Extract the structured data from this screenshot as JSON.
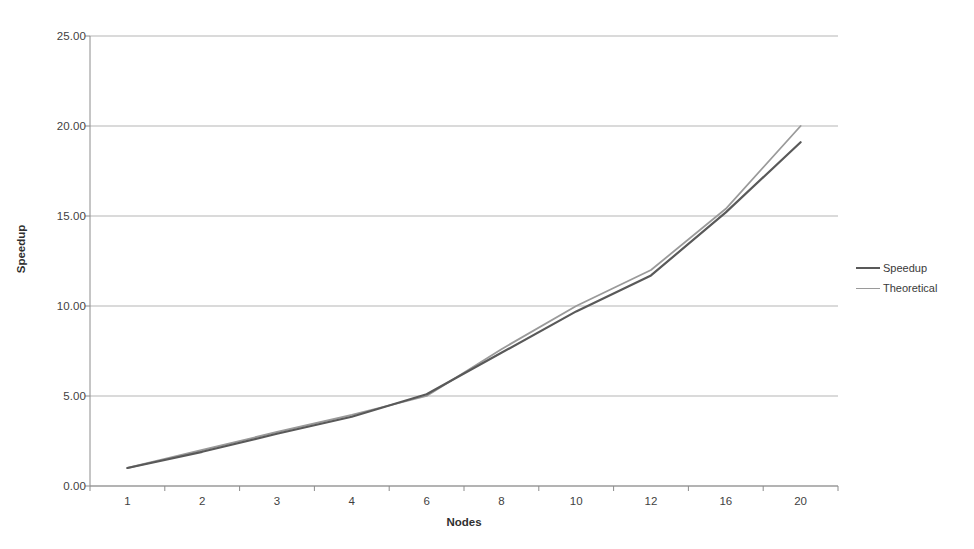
{
  "chart_data": {
    "type": "line",
    "title": "",
    "xlabel": "Nodes",
    "ylabel": "Speedup",
    "categories": [
      "1",
      "2",
      "3",
      "4",
      "6",
      "8",
      "10",
      "12",
      "16",
      "20"
    ],
    "series": [
      {
        "name": "Speedup",
        "color": "#595959",
        "values": [
          1.0,
          1.9,
          2.9,
          3.85,
          5.1,
          7.4,
          9.7,
          11.7,
          15.2,
          19.1
        ]
      },
      {
        "name": "Theoretical",
        "color": "#9a9a9a",
        "values": [
          1.0,
          2.0,
          3.0,
          3.95,
          5.0,
          7.6,
          10.0,
          12.0,
          15.4,
          20.0
        ]
      }
    ],
    "ylim": [
      0.0,
      25.0
    ],
    "yticks": [
      "0.00",
      "5.00",
      "10.00",
      "15.00",
      "20.00",
      "25.00"
    ],
    "ytick_values": [
      0,
      5,
      10,
      15,
      20,
      25
    ],
    "grid": "horizontal",
    "legend_position": "right",
    "background_color": "#ffffff",
    "gridline_color": "#b5b5b5",
    "axis_color": "#8c8c8c"
  }
}
